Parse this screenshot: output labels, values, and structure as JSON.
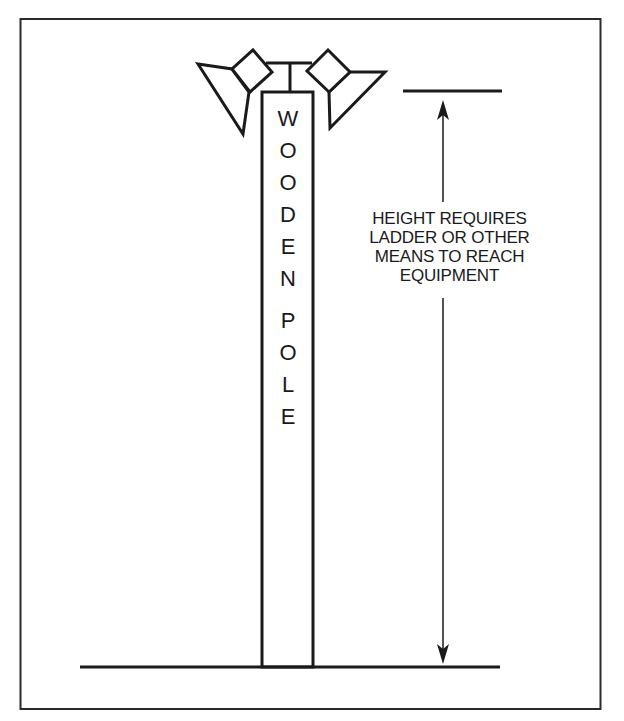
{
  "figure": {
    "pole_label_words": [
      "WOODEN",
      "POLE"
    ],
    "pole_letters": [
      {
        "char": "W",
        "y": 108
      },
      {
        "char": "O",
        "y": 140
      },
      {
        "char": "O",
        "y": 172
      },
      {
        "char": "D",
        "y": 204
      },
      {
        "char": "E",
        "y": 236
      },
      {
        "char": "N",
        "y": 268
      },
      {
        "char": "P",
        "y": 310
      },
      {
        "char": "O",
        "y": 342
      },
      {
        "char": "L",
        "y": 374
      },
      {
        "char": "E",
        "y": 406
      }
    ],
    "annotation": {
      "lines": [
        "HEIGHT REQUIRES",
        "LADDER OR OTHER",
        "MEANS TO REACH",
        "EQUIPMENT"
      ]
    },
    "elements": {
      "light_fixtures": 2,
      "dimension_arrow": "double-headed vertical arrow from top of fixtures to ground"
    },
    "colors": {
      "stroke": "#1a1a1a",
      "background": "#ffffff"
    }
  }
}
